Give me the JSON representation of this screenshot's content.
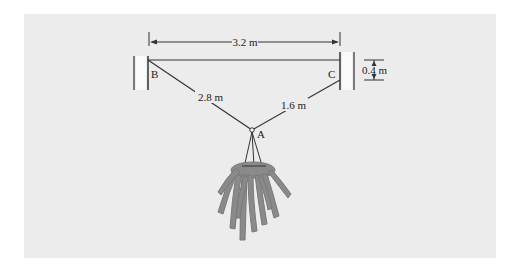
{
  "diagram": {
    "type": "statics-hanging-plant",
    "points": {
      "A": "A",
      "B": "B",
      "C": "C"
    },
    "dimensions": {
      "span_BC": "3.2 m",
      "cable_AB": "2.8 m",
      "cable_AC": "1.6 m",
      "height_offset": "0.4 m"
    },
    "colors": {
      "background": "#ececec",
      "line": "#333333",
      "plant": "#8a8a8a"
    }
  }
}
